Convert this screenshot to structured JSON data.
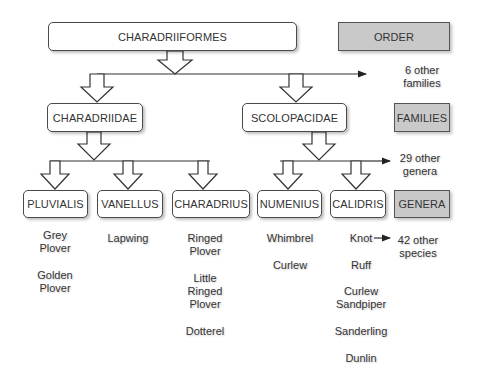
{
  "order": {
    "name": "CHARADRIIFORMES",
    "legend": "ORDER",
    "other": "6 other\nfamilies"
  },
  "families": {
    "legend": "FAMILIES",
    "items": [
      {
        "name": "CHARADRIIDAE"
      },
      {
        "name": "SCOLOPACIDAE"
      }
    ]
  },
  "genera": {
    "legend": "GENERA",
    "other": "29 other\ngenera",
    "items": [
      {
        "name": "PLUVIALIS",
        "species": [
          "Grey\nPlover",
          "Golden\nPlover"
        ]
      },
      {
        "name": "VANELLUS",
        "species": [
          "Lapwing"
        ]
      },
      {
        "name": "CHARADRIUS",
        "species": [
          "Ringed\nPlover",
          "Little\nRinged\nPlover",
          "Dotterel"
        ]
      },
      {
        "name": "NUMENIUS",
        "species": [
          "Whimbrel",
          "Curlew"
        ]
      },
      {
        "name": "CALIDRIS",
        "species": [
          "Knot",
          "Ruff",
          "Curlew\nSandpiper",
          "Sanderling",
          "Dunlin"
        ]
      }
    ]
  },
  "species_other": "42 other\nspecies",
  "colors": {
    "legend_fill": "#c9c9c9",
    "border": "#4a4a4a",
    "text": "#333333"
  }
}
